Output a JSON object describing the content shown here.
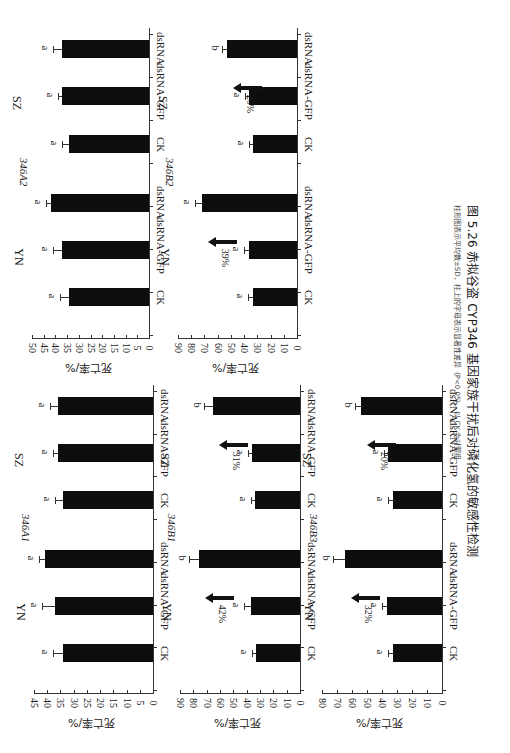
{
  "figure": {
    "caption_title": "图 5.26  赤拟谷盗 CYP346 基因家族干扰后对磷化氢的敏感性检测",
    "caption_note": "柱形图表示平均数±SD，柱上的字母表示显著性差异（P<0.05），以 CK 为对照组",
    "ylabel": "死亡率/%",
    "orientation": "rotated-90"
  },
  "chart_data": [
    {
      "type": "bar",
      "title": "346A1",
      "ylabel": "死亡率/%",
      "ylim": [
        0,
        45
      ],
      "yticks": [
        0,
        5,
        10,
        15,
        20,
        25,
        30,
        35,
        40,
        45
      ],
      "groups": [
        "YN",
        "SZ"
      ],
      "categories": [
        "CK",
        "dsRNA-GFP",
        "dsRNA"
      ],
      "series": [
        {
          "name": "YN",
          "values": [
            34,
            37,
            41
          ],
          "sd": [
            4,
            5,
            2
          ],
          "letters": [
            "a",
            "a",
            "a"
          ],
          "arrow_pct": null
        },
        {
          "name": "SZ",
          "values": [
            34,
            36,
            36
          ],
          "sd": [
            3,
            2,
            3
          ],
          "letters": [
            "a",
            "a",
            "a"
          ],
          "arrow_pct": null
        }
      ]
    },
    {
      "type": "bar",
      "title": "346A2",
      "ylabel": "死亡率/%",
      "ylim": [
        0,
        50
      ],
      "yticks": [
        0,
        5,
        10,
        15,
        20,
        25,
        30,
        35,
        40,
        45,
        50
      ],
      "groups": [
        "YN",
        "SZ"
      ],
      "categories": [
        "CK",
        "dsRNA-GFP",
        "dsRNA"
      ],
      "series": [
        {
          "name": "YN",
          "values": [
            34,
            37,
            42
          ],
          "sd": [
            4,
            4,
            2
          ],
          "letters": [
            "a",
            "a",
            "a"
          ],
          "arrow_pct": null
        },
        {
          "name": "SZ",
          "values": [
            34,
            37,
            37
          ],
          "sd": [
            3,
            2,
            4
          ],
          "letters": [
            "a",
            "a",
            "a"
          ],
          "arrow_pct": null
        }
      ]
    },
    {
      "type": "bar",
      "title": "346B1",
      "ylabel": "死亡率/%",
      "ylim": [
        0,
        90
      ],
      "yticks": [
        0,
        10,
        20,
        30,
        40,
        50,
        60,
        70,
        80,
        90
      ],
      "groups": [
        "YN",
        "SZ"
      ],
      "categories": [
        "CK",
        "dsRNA-GFP",
        "dsRNA"
      ],
      "series": [
        {
          "name": "YN",
          "values": [
            33,
            37,
            76
          ],
          "sd": [
            3,
            5,
            7
          ],
          "letters": [
            "a",
            "a",
            "b"
          ],
          "arrow_pct": "42%"
        },
        {
          "name": "SZ",
          "values": [
            34,
            36,
            65
          ],
          "sd": [
            3,
            3,
            7
          ],
          "letters": [
            "a",
            "a",
            "b"
          ],
          "arrow_pct": "31%"
        }
      ]
    },
    {
      "type": "bar",
      "title": "346B2",
      "ylabel": "死亡率/%",
      "ylim": [
        0,
        90
      ],
      "yticks": [
        0,
        10,
        20,
        30,
        40,
        50,
        60,
        70,
        80,
        90
      ],
      "groups": [
        "YN",
        "SZ"
      ],
      "categories": [
        "CK",
        "dsRNA-GFP",
        "dsRNA"
      ],
      "series": [
        {
          "name": "YN",
          "values": [
            33,
            36,
            72
          ],
          "sd": [
            4,
            4,
            5
          ],
          "letters": [
            "a",
            "a",
            "a"
          ],
          "arrow_pct": "39%"
        },
        {
          "name": "SZ",
          "values": [
            33,
            36,
            53
          ],
          "sd": [
            3,
            3,
            4
          ],
          "letters": [
            "a",
            "a",
            "b"
          ],
          "arrow_pct": "20%"
        }
      ]
    },
    {
      "type": "bar",
      "title": "346B3",
      "ylabel": "死亡率/%",
      "ylim": [
        0,
        80
      ],
      "yticks": [
        0,
        10,
        20,
        30,
        40,
        50,
        60,
        70,
        80
      ],
      "groups": [
        "YN",
        "SZ"
      ],
      "categories": [
        "CK",
        "dsRNA-GFP",
        "dsRNA"
      ],
      "series": [
        {
          "name": "YN",
          "values": [
            33,
            37,
            65
          ],
          "sd": [
            3,
            3,
            8
          ],
          "letters": [
            "a",
            "a",
            "b"
          ],
          "arrow_pct": "32%"
        },
        {
          "name": "SZ",
          "values": [
            33,
            36,
            54
          ],
          "sd": [
            3,
            3,
            4
          ],
          "letters": [
            "a",
            "a",
            "b"
          ],
          "arrow_pct": "20%"
        }
      ]
    }
  ],
  "layout": [
    {
      "chart": 0,
      "x0": 153,
      "xmax": 34,
      "ytop": 385,
      "ybottom": 690
    },
    {
      "chart": 1,
      "x0": 149,
      "xmax": 32,
      "ytop": 28,
      "ybottom": 335
    },
    {
      "chart": 2,
      "x0": 300,
      "xmax": 180,
      "ytop": 385,
      "ybottom": 690
    },
    {
      "chart": 3,
      "x0": 297,
      "xmax": 178,
      "ytop": 28,
      "ybottom": 335
    },
    {
      "chart": 4,
      "x0": 442,
      "xmax": 322,
      "ytop": 385,
      "ybottom": 690
    }
  ]
}
